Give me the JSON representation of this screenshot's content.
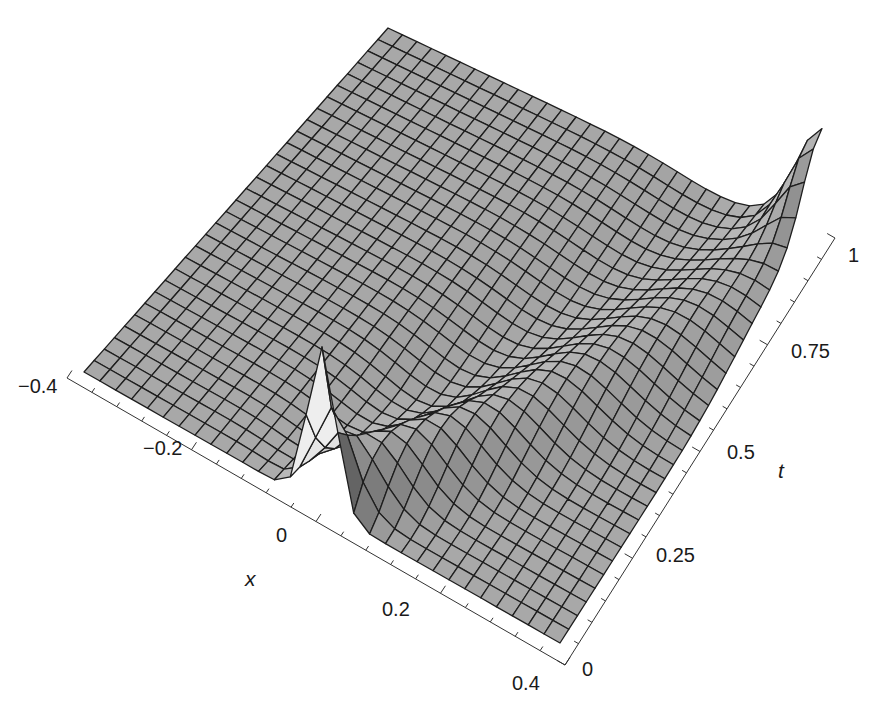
{
  "chart_data": {
    "type": "surface3d",
    "title": "",
    "xlabel": "x",
    "ylabel": "t",
    "zlabel": "",
    "x_range": [
      -0.4,
      0.4
    ],
    "t_range": [
      0,
      1
    ],
    "grid": {
      "nx": 30,
      "nt": 30
    },
    "x_ticks": [
      {
        "value": -0.4,
        "label": "−0.4"
      },
      {
        "value": -0.2,
        "label": "−0.2"
      },
      {
        "value": 0,
        "label": "0"
      },
      {
        "value": 0.2,
        "label": "0.2"
      },
      {
        "value": 0.4,
        "label": "0.4"
      }
    ],
    "t_ticks": [
      {
        "value": 0,
        "label": "0"
      },
      {
        "value": 0.25,
        "label": "0.25"
      },
      {
        "value": 0.5,
        "label": "0.5"
      },
      {
        "value": 0.75,
        "label": "0.75"
      },
      {
        "value": 1,
        "label": "1"
      }
    ],
    "features": [
      {
        "name": "initial spike",
        "x": 0.0,
        "t": 0.0,
        "relative_height": 1.0
      },
      {
        "name": "ridge",
        "path": "x increases with t",
        "relative_height": 0.35
      },
      {
        "name": "far peak",
        "x": 0.4,
        "t": 1.0,
        "relative_height": 0.8
      }
    ],
    "colors": {
      "surface": "#a9a9a9",
      "mesh": "#1e1e1e",
      "background": "#ffffff"
    }
  },
  "axes": {
    "x_title": "x",
    "t_title": "t"
  }
}
